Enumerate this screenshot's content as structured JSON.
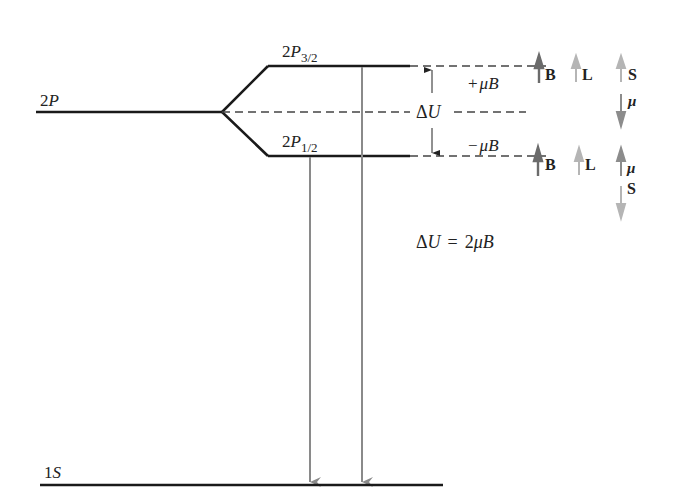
{
  "diagram": {
    "levels": {
      "level_2p": {
        "label_main": "2",
        "label_letter": "P"
      },
      "level_2p32": {
        "label_main": "2",
        "label_letter": "P",
        "label_sub": "3/2"
      },
      "level_2p12": {
        "label_main": "2",
        "label_letter": "P",
        "label_sub": "1/2"
      },
      "level_1s": {
        "label_main": "1",
        "label_letter": "S"
      }
    },
    "energy_labels": {
      "plus": {
        "sign": "+",
        "mu": "μ",
        "B": "B"
      },
      "minus": {
        "sign": "−",
        "mu": "μ",
        "B": "B"
      },
      "delta_u": {
        "delta": "Δ",
        "U": "U"
      }
    },
    "equation": {
      "delta": "Δ",
      "U": "U",
      "equals": "=",
      "coef": "2",
      "mu": "μ",
      "B": "B"
    },
    "vector_diagrams": {
      "upper": [
        {
          "label": "B",
          "direction": "up",
          "shade": "dark"
        },
        {
          "label": "L",
          "direction": "up",
          "shade": "light"
        },
        {
          "label": "S",
          "direction": "up",
          "shade": "light"
        },
        {
          "label": "μ",
          "direction": "down",
          "shade": "medium"
        }
      ],
      "lower": [
        {
          "label": "B",
          "direction": "up",
          "shade": "dark"
        },
        {
          "label": "L",
          "direction": "up",
          "shade": "light"
        },
        {
          "label": "μ",
          "direction": "up",
          "shade": "medium"
        },
        {
          "label": "S",
          "direction": "down",
          "shade": "light"
        }
      ]
    },
    "colors": {
      "level_line": "#1a1a1a",
      "dashed_line": "#444444",
      "transition_arrow": "#8a8a8a",
      "vector_dark": "#6b6b6b",
      "vector_medium": "#8c8c8c",
      "vector_light": "#b5b5b5"
    }
  }
}
